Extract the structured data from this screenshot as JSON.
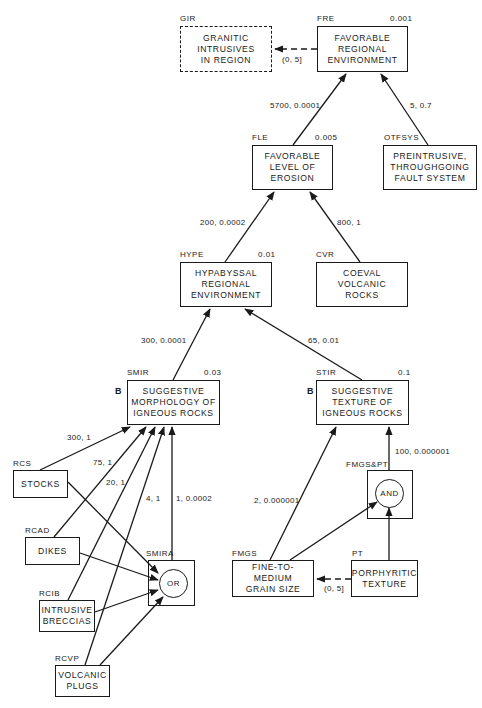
{
  "nodes": {
    "gir": {
      "id": "GIR",
      "label": "GRANITIC\nINTRUSIVES\nIN REGION",
      "prior": ""
    },
    "fre": {
      "id": "FRE",
      "label": "FAVORABLE\nREGIONAL\nENVIRONMENT",
      "prior": "0.001"
    },
    "fle": {
      "id": "FLE",
      "label": "FAVORABLE\nLEVEL OF\nEROSION",
      "prior": "0.005"
    },
    "otfsys": {
      "id": "OTFSYS",
      "label": "PREINTRUSIVE,\nTHROUGHGOING\nFAULT SYSTEM",
      "prior": ""
    },
    "hype": {
      "id": "HYPE",
      "label": "HYPABYSSAL\nREGIONAL\nENVIRONMENT",
      "prior": "0.01"
    },
    "cvr": {
      "id": "CVR",
      "label": "COEVAL\nVOLCANIC\nROCKS",
      "prior": ""
    },
    "smir": {
      "id": "SMIR",
      "label": "SUGGESTIVE\nMORPHOLOGY OF\nIGNEOUS ROCKS",
      "prior": "0.03",
      "mark": "B"
    },
    "stir": {
      "id": "STIR",
      "label": "SUGGESTIVE\nTEXTURE OF\nIGNEOUS ROCKS",
      "prior": "0.1",
      "mark": "B"
    },
    "rcs": {
      "id": "RCS",
      "label": "STOCKS"
    },
    "rcad": {
      "id": "RCAD",
      "label": "DIKES"
    },
    "rcib": {
      "id": "RCIB",
      "label": "INTRUSIVE\nBRECCIAS"
    },
    "rcvp": {
      "id": "RCVP",
      "label": "VOLCANIC\nPLUGS"
    },
    "smira": {
      "id": "SMIRA",
      "gate": "OR"
    },
    "fmgspt": {
      "id": "FMGS&PT",
      "gate": "AND"
    },
    "fmgs": {
      "id": "FMGS",
      "label": "FINE-TO-MEDIUM\nGRAIN SIZE"
    },
    "pt": {
      "id": "PT",
      "label": "PORPHYRITIC\nTEXTURE"
    }
  },
  "edges": {
    "fre_gir": "(0, 5]",
    "fle_fre": "5700, 0.0001",
    "otfsys_fre": "5, 0.7",
    "hype_fle": "200, 0.0002",
    "cvr_fle": "800, 1",
    "smir_hype": "300, 0.0001",
    "stir_hype": "65, 0.01",
    "rcs_smir": "300, 1",
    "rcad_smir": "75, 1",
    "rcib_smir": "20, 1",
    "rcvp_smir": "4, 1",
    "smira_smir": "1, 0.0002",
    "fmgs_stir": "2, 0.000001",
    "fmgspt_stir": "100, 0.000001",
    "pt_fmgs": "(0, 5]"
  }
}
